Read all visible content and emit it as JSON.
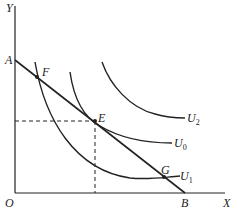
{
  "axes": {
    "y_label": "Y",
    "x_label": "X",
    "origin_label": "O"
  },
  "points": {
    "A": "A",
    "B": "B",
    "E": "E",
    "F": "F",
    "G": "G"
  },
  "curves": {
    "U2": {
      "name": "U",
      "sub": "2"
    },
    "U0": {
      "name": "U",
      "sub": "0"
    },
    "U1": {
      "name": "U",
      "sub": "1"
    }
  },
  "colors": {
    "line": "#222222",
    "background": "#ffffff"
  }
}
